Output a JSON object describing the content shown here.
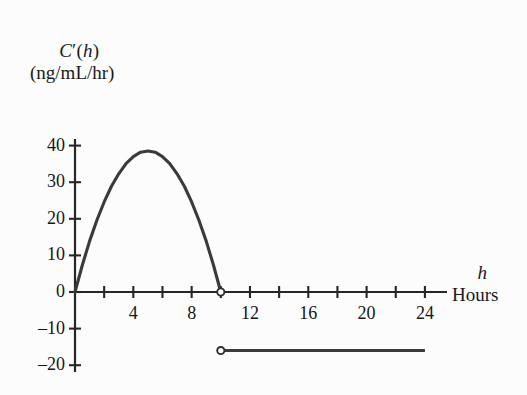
{
  "chart_data": {
    "type": "line",
    "title": "",
    "subtitle": "",
    "xlabel": "h",
    "xlabel_sub": "Hours",
    "ylabel": "C′(h)",
    "ylabel_sub": "(ng/mL/hr)",
    "xlim": [
      0,
      25.6
    ],
    "ylim": [
      -21.5,
      43
    ],
    "grid": false,
    "legend": false,
    "x_tick_values": [
      2,
      4,
      6,
      8,
      10,
      12,
      14,
      16,
      18,
      20,
      22,
      24
    ],
    "x_tick_labels": [
      "",
      "4",
      "",
      "8",
      "",
      "",
      "12",
      "",
      "16",
      "",
      "20",
      "",
      "24"
    ],
    "x_labeled_ticks": [
      {
        "value": 4,
        "label": "4"
      },
      {
        "value": 8,
        "label": "8"
      },
      {
        "value": 12,
        "label": "12"
      },
      {
        "value": 16,
        "label": "16"
      },
      {
        "value": 20,
        "label": "20"
      },
      {
        "value": 24,
        "label": "24"
      }
    ],
    "y_tick_values": [
      40,
      30,
      20,
      10,
      0,
      -10,
      -20
    ],
    "y_tick_labels": [
      "40",
      "30",
      "20",
      "10",
      "0",
      "–10",
      "–20"
    ],
    "curve_color": "#3a3a3a",
    "axis_color": "#262626",
    "series": [
      {
        "name": "parabolic-arc",
        "type": "line",
        "domain": [
          0,
          10
        ],
        "description": "Downward parabola through (0,0), peak about 38.5 at h=5, back to 0 at h=10",
        "x": [
          0,
          0.5,
          1,
          1.5,
          2,
          2.5,
          3,
          3.5,
          4,
          4.5,
          5,
          5.5,
          6,
          6.5,
          7,
          7.5,
          8,
          8.5,
          9,
          9.5,
          10
        ],
        "y": [
          0,
          7.3,
          13.9,
          19.6,
          24.6,
          28.9,
          32.3,
          35.1,
          37.0,
          38.2,
          38.5,
          38.2,
          37.0,
          35.1,
          32.3,
          28.9,
          24.6,
          19.6,
          13.9,
          7.3,
          0
        ],
        "endpoint_open_circle": {
          "x": 10,
          "y": 0
        }
      },
      {
        "name": "constant-segment",
        "type": "line",
        "domain": [
          10,
          24
        ],
        "description": "Horizontal constant segment at approximately -16 from h=10 to h=24",
        "x": [
          10,
          24
        ],
        "y": [
          -16,
          -16
        ],
        "start_open_circle": {
          "x": 10,
          "y": -16
        }
      }
    ],
    "annotations": [
      {
        "kind": "open-circle",
        "x": 10,
        "y": 0
      },
      {
        "kind": "open-circle",
        "x": 10,
        "y": -16
      }
    ]
  }
}
